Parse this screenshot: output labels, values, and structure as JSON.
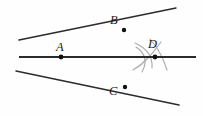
{
  "figure": {
    "kind": "geometry-construction-diagram",
    "background_color": "#fefefe",
    "width": 203,
    "height": 116,
    "line_color": "#2b2b2b",
    "arc_color": "#a9a9a9",
    "dot_color": "#111111",
    "label_color": "#1a1a1a",
    "labels": {
      "A": "A",
      "B": "B",
      "C": "C",
      "D": "D"
    },
    "points": [
      {
        "name": "A",
        "x": 61,
        "y": 57,
        "has_dot": true,
        "label": "A",
        "label_x": 56,
        "label_y": 41
      },
      {
        "name": "B",
        "x": 124,
        "y": 30,
        "has_dot": true,
        "label": "B",
        "label_x": 110,
        "label_y": 14
      },
      {
        "name": "C",
        "x": 125,
        "y": 87,
        "has_dot": true,
        "label": "C",
        "label_x": 109,
        "label_y": 85
      },
      {
        "name": "D",
        "x": 155,
        "y": 57,
        "has_dot": true,
        "label": "D",
        "label_x": 148,
        "label_y": 38
      }
    ],
    "lines": [
      {
        "name": "horizontal-line",
        "x1": 19,
        "y1": 57,
        "x2": 196,
        "y2": 57,
        "width": 2.1
      },
      {
        "name": "line-through-A-and-B",
        "x1": 19,
        "y1": 40,
        "x2": 176,
        "y2": 8,
        "width": 1.5
      },
      {
        "name": "line-through-A-and-C",
        "x1": 16,
        "y1": 71,
        "x2": 179,
        "y2": 105,
        "width": 1.5
      },
      {
        "name": "short-ray-lower-left-of-A",
        "x1": 16,
        "y1": 71,
        "x2": 61,
        "y2": 57,
        "width": 1.5
      }
    ],
    "arcs": [
      {
        "name": "compass-arc-upper-left",
        "d": "M 136 44 Q 150 55 149 72",
        "width": 1.1
      },
      {
        "name": "compass-arc-lower-left",
        "d": "M 134 69 Q 150 60 162 44",
        "width": 1.1
      },
      {
        "name": "compass-arc-right-upper",
        "d": "M 150 40 Q 160 52 166 70",
        "width": 1.1
      },
      {
        "name": "compass-arc-left-long",
        "d": "M 135 46 Q 146 58 140 72",
        "width": 1.1
      }
    ]
  }
}
